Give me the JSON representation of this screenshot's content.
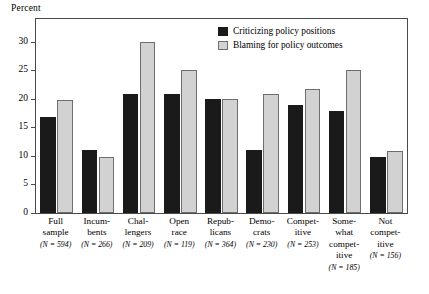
{
  "chart_data": {
    "type": "bar",
    "title": "",
    "xlabel": "",
    "ylabel": "Percent",
    "ylim": [
      0,
      34
    ],
    "yticks": [
      0,
      5,
      10,
      15,
      20,
      25,
      30
    ],
    "grid": false,
    "legend_position": "top-right",
    "categories": [
      "Full sample",
      "Incumbents",
      "Challengers",
      "Open race",
      "Republicans",
      "Democrats",
      "Competitive",
      "Somewhat competitive",
      "Not competitive"
    ],
    "category_lines": [
      [
        "Full",
        "sample"
      ],
      [
        "Incum-",
        "bents"
      ],
      [
        "Chal-",
        "lengers"
      ],
      [
        "Open",
        "race"
      ],
      [
        "Repub-",
        "licans"
      ],
      [
        "Demo-",
        "crats"
      ],
      [
        "Compet-",
        "itive"
      ],
      [
        "Some-",
        "what",
        "compet-",
        "itive"
      ],
      [
        "Not",
        "compet-",
        "itive"
      ]
    ],
    "category_notes": [
      "(N = 594)",
      "(N = 266)",
      "(N = 209)",
      "(N = 119)",
      "(N = 364)",
      "(N = 230)",
      "(N = 253)",
      "(N = 185)",
      "(N = 156)"
    ],
    "sample_sizes": [
      594,
      266,
      209,
      119,
      364,
      230,
      253,
      185,
      156
    ],
    "series": [
      {
        "name": "Criticizing policy positions",
        "color": "#1a1a1a",
        "values": [
          16.8,
          11.0,
          20.9,
          20.9,
          19.9,
          11.0,
          18.9,
          17.9,
          9.8
        ]
      },
      {
        "name": "Blaming for policy outcomes",
        "color": "#d2d2d2",
        "values": [
          19.8,
          9.8,
          29.9,
          25.0,
          19.9,
          20.9,
          21.8,
          25.0,
          10.9
        ]
      }
    ]
  }
}
